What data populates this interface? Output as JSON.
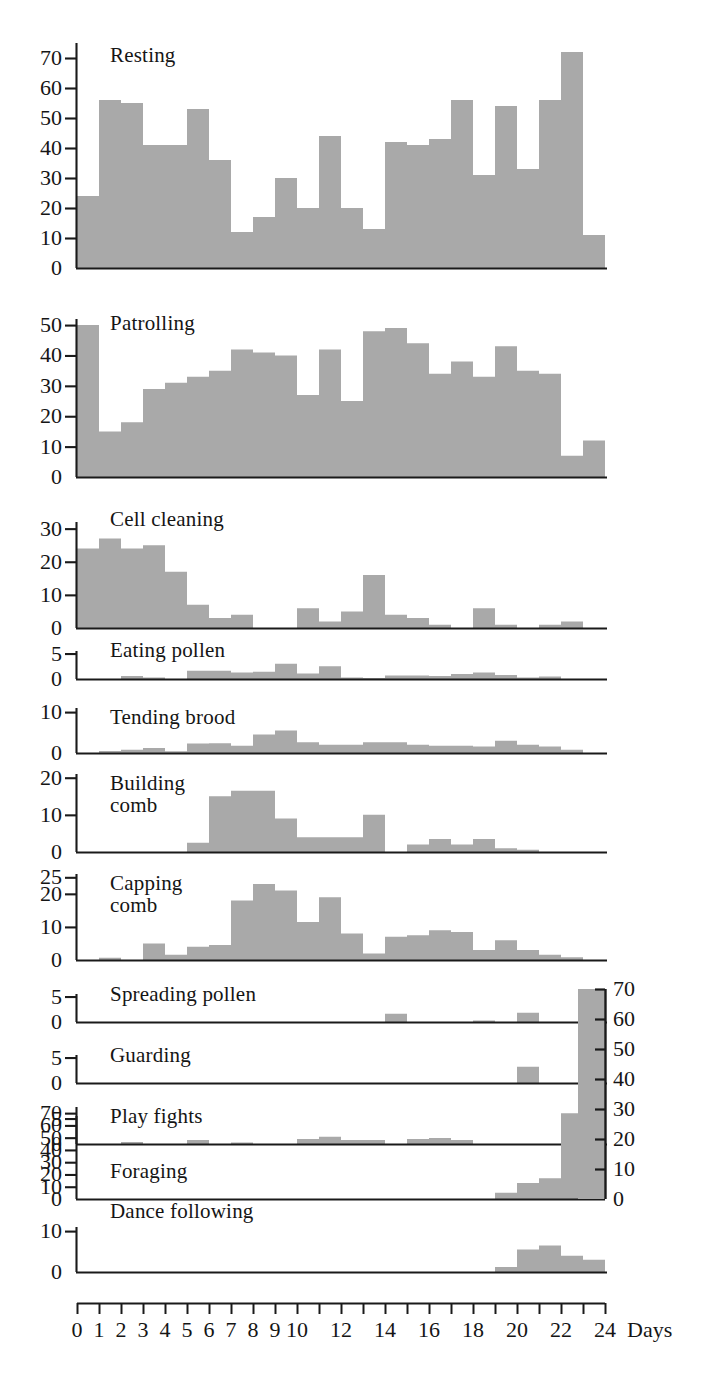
{
  "figure": {
    "title": "",
    "x_axis": {
      "label": "Days",
      "min": 0,
      "max": 24,
      "tick_values": [
        0,
        1,
        2,
        3,
        4,
        5,
        6,
        7,
        8,
        9,
        10,
        11,
        12,
        13,
        14,
        15,
        16,
        17,
        18,
        19,
        20,
        21,
        22,
        23,
        24
      ],
      "tick_labels": [
        "0",
        "1",
        "2",
        "3",
        "4",
        "5",
        "6",
        "7",
        "8",
        "9",
        "10",
        "",
        "12",
        "",
        "14",
        "",
        "16",
        "",
        "18",
        "",
        "20",
        "",
        "22",
        "",
        "24"
      ]
    },
    "fill_color": "#a9a9a9",
    "line_color": "#1a1a1a",
    "background": "#ffffff"
  },
  "chart_data": {
    "type": "bar",
    "title": "",
    "xlabel": "Days",
    "ylabel": "",
    "grid": false,
    "legend": "none",
    "x": [
      0,
      1,
      2,
      3,
      4,
      5,
      6,
      7,
      8,
      9,
      10,
      11,
      12,
      13,
      14,
      15,
      16,
      17,
      18,
      19,
      20,
      21,
      22,
      23
    ],
    "panels": [
      {
        "name": "resting",
        "label": "Resting",
        "ylim": [
          0,
          75
        ],
        "yticks": [
          0,
          10,
          20,
          30,
          40,
          50,
          60,
          70
        ],
        "values": [
          24,
          56,
          55,
          41,
          41,
          53,
          36,
          12,
          17,
          30,
          20,
          44,
          20,
          13,
          42,
          41,
          43,
          56,
          31,
          54,
          33,
          56,
          72,
          11
        ]
      },
      {
        "name": "patrolling",
        "label": "Patrolling",
        "ylim": [
          0,
          52
        ],
        "yticks": [
          0,
          10,
          20,
          30,
          40,
          50
        ],
        "values": [
          50,
          15,
          18,
          29,
          31,
          33,
          35,
          42,
          41,
          40,
          27,
          42,
          25,
          48,
          49,
          44,
          34,
          38,
          33,
          43,
          35,
          34,
          7,
          12
        ]
      },
      {
        "name": "cell-cleaning",
        "label": "Cell cleaning",
        "ylim": [
          0,
          32
        ],
        "yticks": [
          0,
          10,
          20,
          30
        ],
        "values": [
          24,
          27,
          24,
          25,
          17,
          7,
          3,
          4,
          0,
          0,
          6,
          2,
          5,
          16,
          4,
          3,
          1,
          0,
          6,
          1,
          0,
          1,
          2,
          0
        ]
      },
      {
        "name": "eating-pollen",
        "label": "Eating pollen",
        "ylim": [
          0,
          5.5
        ],
        "yticks": [
          0,
          5
        ],
        "values": [
          0,
          0,
          0.6,
          0.3,
          0,
          1.6,
          1.6,
          1.3,
          1.4,
          3,
          1.1,
          2.5,
          0.3,
          0.2,
          0.7,
          0.7,
          0.6,
          1,
          1.3,
          0.8,
          0.3,
          0.5,
          0,
          0
        ]
      },
      {
        "name": "tending-brood",
        "label": "Tending brood",
        "ylim": [
          0,
          11
        ],
        "yticks": [
          0,
          10
        ],
        "values": [
          0,
          0.5,
          0.8,
          1.2,
          0.4,
          2.3,
          2.4,
          1.8,
          4.5,
          5.5,
          2.6,
          2,
          2,
          2.6,
          2.6,
          2,
          1.8,
          1.8,
          1.6,
          3,
          2,
          1.6,
          0.8,
          0
        ]
      },
      {
        "name": "building-comb",
        "label": "Building\ncomb",
        "ylim": [
          0,
          21
        ],
        "yticks": [
          0,
          10,
          20
        ],
        "values": [
          0,
          0,
          0,
          0,
          0,
          2.5,
          15,
          16.5,
          16.5,
          9,
          4,
          4,
          4,
          10,
          0,
          2,
          3.5,
          2,
          3.5,
          1,
          0.6,
          0,
          0,
          0
        ]
      },
      {
        "name": "capping-comb",
        "label": "Capping\ncomb",
        "ylim": [
          0,
          26
        ],
        "yticks": [
          0,
          10,
          20,
          25
        ],
        "values": [
          0,
          0.7,
          0,
          5,
          1.6,
          4,
          4.5,
          18,
          23,
          21,
          11.5,
          19,
          8,
          2,
          7,
          7.5,
          9,
          8.5,
          3,
          6,
          3,
          1.6,
          0.8,
          0
        ]
      },
      {
        "name": "spreading-pollen",
        "label": "Spreading pollen",
        "ylim": [
          0,
          5.5
        ],
        "yticks": [
          0,
          5
        ],
        "values": [
          0,
          0,
          0,
          0,
          0,
          0,
          0,
          0,
          0,
          0,
          0,
          0,
          0,
          0,
          1.6,
          0,
          0,
          0,
          0.3,
          0,
          1.8,
          0,
          0,
          0
        ]
      },
      {
        "name": "guarding",
        "label": "Guarding",
        "ylim": [
          0,
          5.5
        ],
        "yticks": [
          0,
          5
        ],
        "values": [
          0,
          0,
          0,
          0,
          0,
          0,
          0,
          0,
          0,
          0,
          0,
          0,
          0,
          0,
          0,
          0,
          0,
          0,
          0,
          0,
          3.2,
          0,
          0,
          0
        ]
      },
      {
        "name": "play-fights",
        "label": "Play fights",
        "ylim": [
          0,
          5.5
        ],
        "yticks": [
          0,
          5
        ],
        "values": [
          0,
          0,
          0.4,
          0,
          0,
          0.8,
          0,
          0.3,
          0,
          0,
          1,
          1.4,
          0.8,
          0.8,
          0,
          1,
          1.2,
          0.8,
          0,
          0,
          0,
          0,
          0,
          0
        ]
      },
      {
        "name": "foraging",
        "label": "Foraging",
        "ylim": [
          0,
          75
        ],
        "yticks": [
          0,
          10,
          20,
          30,
          40,
          50,
          60,
          70
        ],
        "right_axis": true,
        "values": [
          0,
          0,
          0,
          0,
          0,
          0,
          0,
          0,
          0,
          0,
          0,
          0,
          0,
          0,
          0,
          0,
          0,
          0,
          0,
          5,
          13,
          17,
          70,
          70
        ]
      },
      {
        "name": "dance-following",
        "label": "Dance following",
        "ylim": [
          0,
          11
        ],
        "yticks": [
          0,
          10
        ],
        "values": [
          0,
          0,
          0,
          0,
          0,
          0,
          0,
          0,
          0,
          0,
          0,
          0,
          0,
          0,
          0,
          0,
          0,
          0,
          0,
          1.2,
          5.5,
          6.5,
          4,
          3
        ]
      }
    ]
  }
}
